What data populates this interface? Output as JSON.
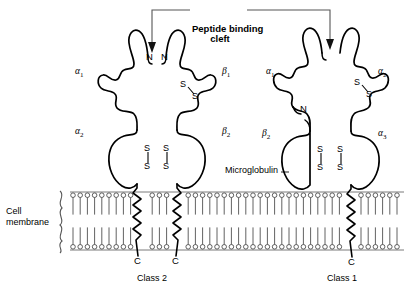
{
  "figure": {
    "title_annotation": {
      "line1": "Peptide binding",
      "line2": "cleft"
    },
    "membrane_label": {
      "line1": "Cell",
      "line2": "membrane"
    },
    "microglobulin_label": "Microglobulin",
    "class2": {
      "name": "Class 2",
      "chain_a_domains": [
        "α",
        "α"
      ],
      "chain_a_subs": [
        "1",
        "2"
      ],
      "chain_b_domains": [
        "β",
        "β"
      ],
      "chain_b_subs": [
        "1",
        "2"
      ],
      "n_termini": [
        "N",
        "N"
      ],
      "c_termini": [
        "C",
        "C"
      ],
      "disulfides": [
        {
          "s1": "S",
          "s2": "S",
          "orientation": "diagonal",
          "domain": "β1"
        },
        {
          "s1": "S",
          "s2": "S",
          "orientation": "vertical",
          "domain": "α2"
        },
        {
          "s1": "S",
          "s2": "S",
          "orientation": "vertical",
          "domain": "β2"
        }
      ]
    },
    "class1": {
      "name": "Class 1",
      "heavy_chain_domains": [
        "α",
        "α",
        "α"
      ],
      "heavy_chain_subs": [
        "1",
        "2",
        "3"
      ],
      "light_chain_domain": "β",
      "light_chain_sub": "2",
      "n_termini": [
        "N"
      ],
      "c_termini": [
        "C"
      ],
      "disulfides": [
        {
          "s1": "S",
          "s2": "S",
          "orientation": "diagonal",
          "domain": "α2"
        },
        {
          "s1": "S",
          "s2": "S",
          "orientation": "vertical",
          "domain": "β2"
        },
        {
          "s1": "S",
          "s2": "S",
          "orientation": "vertical",
          "domain": "α3"
        }
      ]
    },
    "colors": {
      "stroke": "#000000",
      "membrane_line": "#6b6b6b",
      "bracket": "#555555",
      "background": "#ffffff"
    }
  }
}
